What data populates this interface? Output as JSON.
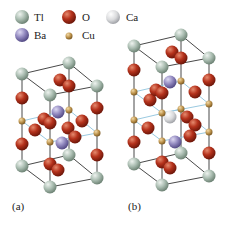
{
  "legend": {
    "items": [
      {
        "element": "Tl",
        "label": "Tl",
        "color": "#a9bcb0",
        "size": "large"
      },
      {
        "element": "O",
        "label": "O",
        "color": "#b5321c",
        "size": "large"
      },
      {
        "element": "Ca",
        "label": "Ca",
        "color": "#d9dadc",
        "size": "large"
      },
      {
        "element": "Ba",
        "label": "Ba",
        "color": "#8f86bd",
        "size": "large"
      },
      {
        "element": "Cu",
        "label": "Cu",
        "color": "#c0964f",
        "size": "small"
      }
    ]
  },
  "panels": [
    {
      "id": "a",
      "label": "(a)"
    },
    {
      "id": "b",
      "label": "(b)"
    }
  ],
  "colors": {
    "Tl": "#a9bcb0",
    "O": "#b5321c",
    "Ca": "#d9dadc",
    "Ba": "#8f86bd",
    "Cu": "#c0964f",
    "cell_edge": "#333333",
    "cuo_plane_edge": "#8fc3dd"
  }
}
